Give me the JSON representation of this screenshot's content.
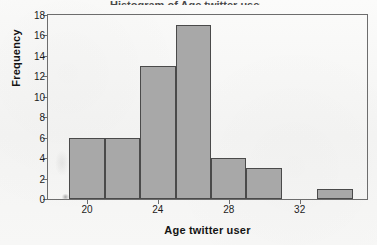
{
  "figure": {
    "title_cropped": "Histogram of Age twitter user",
    "background_color": "#f6f6f5",
    "frame_color": "#6d6d6d",
    "bar_fill_color": "#a8a8a8",
    "bar_edge_color": "#4a4a4a"
  },
  "axis_titles": {
    "y": "Frequency",
    "x": "Age twitter user"
  },
  "y_ticks": [
    "0",
    "2",
    "4",
    "6",
    "8",
    "10",
    "12",
    "14",
    "16",
    "18"
  ],
  "x_ticks": [
    "20",
    "24",
    "28",
    "32"
  ],
  "chart_data": {
    "type": "bar",
    "title": "Histogram of Age twitter user",
    "xlabel": "Age twitter user",
    "ylabel": "Frequency",
    "categories": [
      "19-21",
      "21-23",
      "23-25",
      "25-27",
      "27-29",
      "29-31",
      "31-33",
      "33-35"
    ],
    "bin_edges": [
      19,
      21,
      23,
      25,
      27,
      29,
      31,
      33,
      35
    ],
    "bin_width": 2,
    "values": [
      6,
      6,
      13,
      17,
      4,
      3,
      0,
      1
    ],
    "x": [
      20,
      22,
      24,
      26,
      28,
      30,
      32,
      34
    ],
    "xlim": [
      17.8,
      35.8
    ],
    "ylim": [
      0,
      18
    ],
    "ytick_values": [
      0,
      2,
      4,
      6,
      8,
      10,
      12,
      14,
      16,
      18
    ],
    "xtick_values": [
      20,
      24,
      28,
      32
    ],
    "grid": false,
    "legend": null,
    "total_count": 50
  }
}
